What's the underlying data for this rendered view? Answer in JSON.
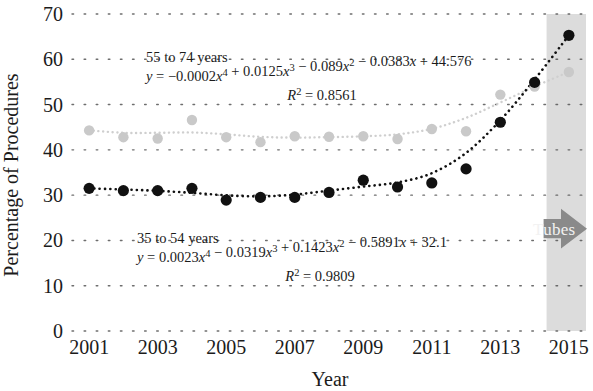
{
  "figure": {
    "background": "#ffffff",
    "plot_left": 72,
    "plot_right": 586,
    "plot_top": 14,
    "plot_bottom": 331
  },
  "chart_data": {
    "type": "scatter",
    "title": "",
    "xlabel": "Year",
    "ylabel": "Percentage of Procedures",
    "xlim": [
      2000.5,
      2015.5
    ],
    "ylim": [
      0,
      70
    ],
    "ytick_labels": [
      "0",
      "10",
      "20",
      "30",
      "40",
      "50",
      "60",
      "70"
    ],
    "ytick_values": [
      0,
      10,
      20,
      30,
      40,
      50,
      60,
      70
    ],
    "xtick_labels": [
      "2001",
      "2003",
      "2005",
      "2007",
      "2009",
      "2011",
      "2013",
      "2015"
    ],
    "xtick_values": [
      2001,
      2003,
      2005,
      2007,
      2009,
      2011,
      2013,
      2015
    ],
    "grid": "dotted-horizontal",
    "legend": "none",
    "x": [
      2001,
      2002,
      2003,
      2004,
      2005,
      2006,
      2007,
      2008,
      2009,
      2010,
      2011,
      2012,
      2013,
      2014,
      2015
    ],
    "series": [
      {
        "name": "55 to 74 years",
        "color": "#c9c9c9",
        "marker": "circle",
        "trend": "dotted",
        "values": [
          44.3,
          42.8,
          42.5,
          46.6,
          42.8,
          41.7,
          43.0,
          42.9,
          43.0,
          42.4,
          44.6,
          44.1,
          52.2,
          54.0,
          57.2
        ]
      },
      {
        "name": "35 to 54 years",
        "color": "#111111",
        "marker": "circle",
        "trend": "dotted",
        "values": [
          31.5,
          31.0,
          31.0,
          31.5,
          28.9,
          29.5,
          29.5,
          30.6,
          33.3,
          31.8,
          32.7,
          35.8,
          46.1,
          54.9,
          65.3
        ]
      }
    ],
    "annotations": [
      {
        "name": "annotation-55-74",
        "label": "55 to 74 years",
        "equation_plain": "y = −0.0002x⁴ + 0.0125x³ − 0.089x² − 0.0383x + 44.576",
        "equation_parts": [
          {
            "t": "y",
            "i": true
          },
          {
            "t": " = ",
            "i": false
          },
          {
            "t": "−0.0002",
            "i": false
          },
          {
            "t": "x",
            "i": true
          },
          {
            "t": "4",
            "sup": true
          },
          {
            "t": " + 0.0125",
            "i": false
          },
          {
            "t": "x",
            "i": true
          },
          {
            "t": "3",
            "sup": true
          },
          {
            "t": " − 0.089",
            "i": false
          },
          {
            "t": "x",
            "i": true
          },
          {
            "t": "2",
            "sup": true
          },
          {
            "t": " − 0.0383",
            "i": false
          },
          {
            "t": "x",
            "i": true
          },
          {
            "t": " + 44.576",
            "i": false
          }
        ],
        "r2_label": "R",
        "r2_sup": "2",
        "r2_value": "= 0.8561",
        "r2_plain": "R² = 0.8561"
      },
      {
        "name": "annotation-35-54",
        "label": "35 to 54 years",
        "equation_plain": "y = 0.0023x⁴ − 0.0319x³ + 0.1423x² − 0.5891x + 32.1",
        "equation_parts": [
          {
            "t": "y",
            "i": true
          },
          {
            "t": " = ",
            "i": false
          },
          {
            "t": "0.0023",
            "i": false
          },
          {
            "t": "x",
            "i": true
          },
          {
            "t": "4",
            "sup": true
          },
          {
            "t": " − 0.0319",
            "i": false
          },
          {
            "t": "x",
            "i": true
          },
          {
            "t": "3",
            "sup": true
          },
          {
            "t": " + 0.1423",
            "i": false
          },
          {
            "t": "x",
            "i": true
          },
          {
            "t": "2",
            "sup": true
          },
          {
            "t": " − 0.5891",
            "i": false
          },
          {
            "t": "x",
            "i": true
          },
          {
            "t": " + 32.1",
            "i": false
          }
        ],
        "r2_label": "R",
        "r2_sup": "2",
        "r2_value": "= 0.9809",
        "r2_plain": "R² = 0.9809"
      }
    ],
    "shaded_region": {
      "name": "tubes-era-band",
      "x_start": 2014.35,
      "x_end": 2015.5,
      "color": "#d6d6d6"
    },
    "callout_arrow": {
      "name": "tubes-arrow",
      "label": "Tubes",
      "color": "#8a8a8a",
      "text_color": "#f2f2f2",
      "direction": "right"
    }
  }
}
